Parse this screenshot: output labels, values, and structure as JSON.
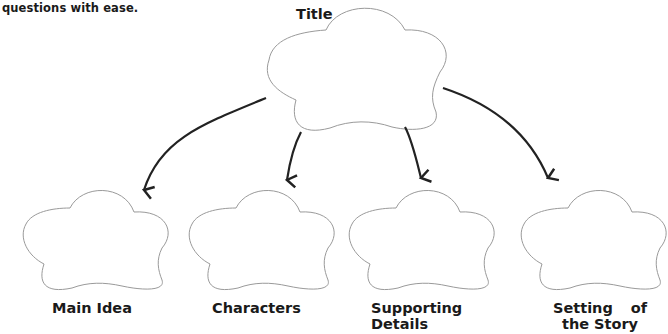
{
  "intro_text": "questions with ease.",
  "diagram": {
    "type": "graphic-organizer-tree",
    "root": {
      "label": "Title"
    },
    "children": [
      {
        "label": "Main Idea"
      },
      {
        "label": "Characters"
      },
      {
        "label": "Supporting Details",
        "line1": "Supporting",
        "line2": "Details"
      },
      {
        "label": "Setting of the Story",
        "line1a": "Setting",
        "line1b": "of",
        "line2": "the Story"
      }
    ],
    "colors": {
      "cloud_stroke": "#9a9a9a",
      "arrow": "#222222",
      "text": "#1a1a1a"
    }
  }
}
